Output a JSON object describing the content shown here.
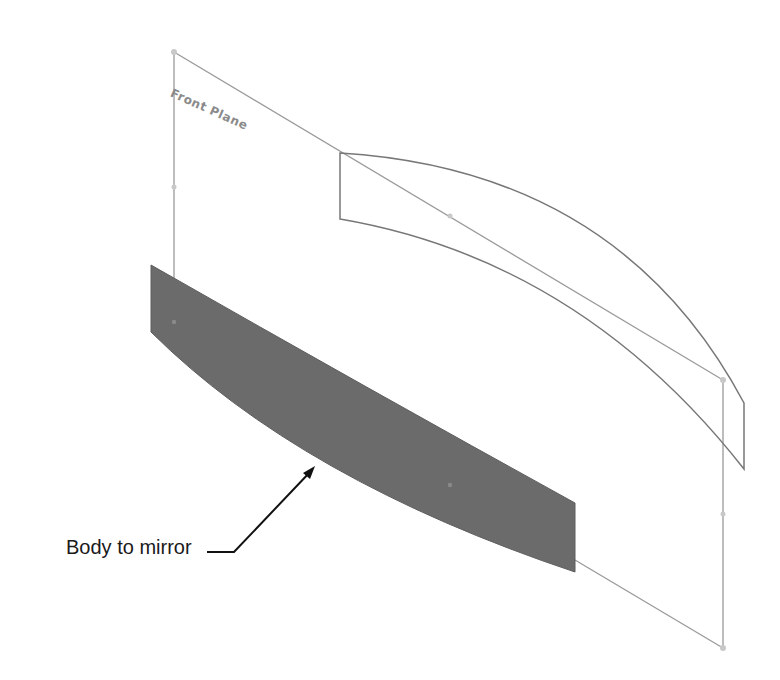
{
  "diagram": {
    "plane_label": "Front Plane",
    "callout_label": "Body to mirror",
    "colors": {
      "background": "#ffffff",
      "plane_edge": "#9a9a9a",
      "body_fill": "#6b6b6b",
      "sketch_edge": "#777777",
      "callout": "#111111",
      "text": "#1a1a1a"
    }
  }
}
